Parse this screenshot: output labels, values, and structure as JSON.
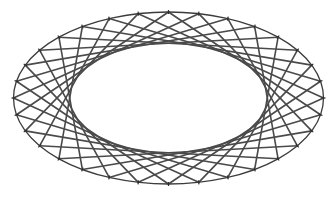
{
  "diagram": {
    "type": "string-art-ellipse",
    "point_count": 32,
    "chord_step": 9,
    "show_outline": true,
    "show_point_ticks": true,
    "colors": {
      "line": "#4a4a4a",
      "outline": "#3c3c3c",
      "tick": "#2e2e2e",
      "background": "#ffffff"
    }
  }
}
